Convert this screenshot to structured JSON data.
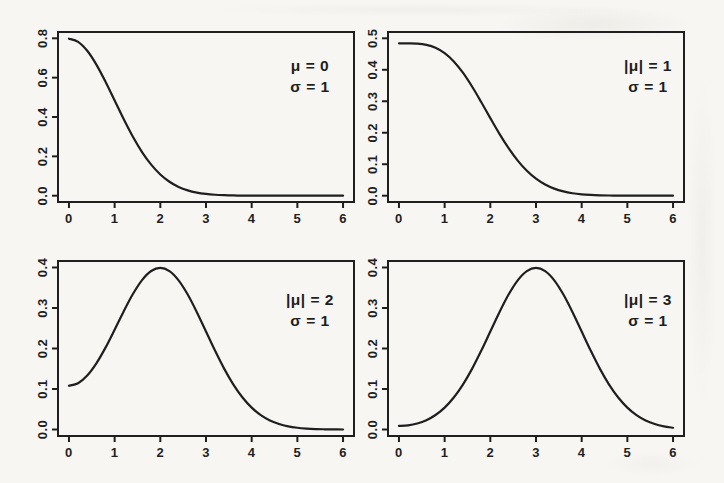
{
  "page": {
    "paper_color": "#f7f6f2",
    "line_color": "#1f1f1f"
  },
  "chart_data": [
    {
      "type": "line",
      "panel": "top-left",
      "title": "",
      "xlabel": "",
      "ylabel": "",
      "annotation": [
        "μ = 0",
        "σ = 1"
      ],
      "legend": null,
      "grid": false,
      "xlim": [
        0,
        6
      ],
      "ylim": [
        0,
        0.8
      ],
      "xticks": [
        0,
        1,
        2,
        3,
        4,
        5,
        6
      ],
      "xtick_labels": [
        "0",
        "1",
        "2",
        "3",
        "4",
        "5",
        "6"
      ],
      "yticks": [
        0,
        0.2,
        0.4,
        0.6,
        0.8
      ],
      "ytick_labels": [
        "0.0",
        "0.2",
        "0.4",
        "0.6",
        "0.8"
      ],
      "x": [
        0,
        0.2,
        0.4,
        0.6,
        0.8,
        1,
        1.2,
        1.4,
        1.6,
        1.8,
        2,
        2.2,
        2.4,
        2.6,
        2.8,
        3,
        3.2,
        3.4,
        3.6,
        3.8,
        4,
        4.2,
        4.4,
        4.6,
        4.8,
        5,
        5.2,
        5.4,
        5.6,
        5.8,
        6
      ],
      "y": [
        0.7979,
        0.7821,
        0.7365,
        0.6664,
        0.5794,
        0.4839,
        0.3884,
        0.2995,
        0.2218,
        0.1579,
        0.108,
        0.071,
        0.0448,
        0.0272,
        0.0158,
        0.0089,
        0.0048,
        0.0025,
        0.0012,
        0.0006,
        0.0003,
        0.0001,
        0.0001,
        0.0,
        0.0,
        0.0,
        0.0,
        0.0,
        0.0,
        0.0,
        0.0
      ]
    },
    {
      "type": "line",
      "panel": "top-right",
      "title": "",
      "xlabel": "",
      "ylabel": "",
      "annotation": [
        "|μ| = 1",
        "σ = 1"
      ],
      "legend": null,
      "grid": false,
      "xlim": [
        0,
        6
      ],
      "ylim": [
        0,
        0.5
      ],
      "xticks": [
        0,
        1,
        2,
        3,
        4,
        5,
        6
      ],
      "xtick_labels": [
        "0",
        "1",
        "2",
        "3",
        "4",
        "5",
        "6"
      ],
      "yticks": [
        0,
        0.1,
        0.2,
        0.3,
        0.4,
        0.5
      ],
      "ytick_labels": [
        "0.0",
        "0.1",
        "0.2",
        "0.3",
        "0.4",
        "0.5"
      ],
      "x": [
        0,
        0.2,
        0.4,
        0.6,
        0.8,
        1,
        1.2,
        1.4,
        1.6,
        1.8,
        2,
        2.2,
        2.4,
        2.6,
        2.8,
        3,
        3.2,
        3.4,
        3.6,
        3.8,
        4,
        4.2,
        4.4,
        4.6,
        4.8,
        5,
        5.2,
        5.4,
        5.6,
        5.8,
        6
      ],
      "y": [
        0.4839,
        0.4839,
        0.483,
        0.4792,
        0.47,
        0.4529,
        0.4265,
        0.3907,
        0.3468,
        0.2976,
        0.2464,
        0.1966,
        0.151,
        0.1115,
        0.0792,
        0.0541,
        0.0355,
        0.0224,
        0.0136,
        0.0079,
        0.0044,
        0.0024,
        0.0012,
        0.0006,
        0.0003,
        0.0001,
        0.0001,
        0.0,
        0.0,
        0.0,
        0.0
      ]
    },
    {
      "type": "line",
      "panel": "bottom-left",
      "title": "",
      "xlabel": "",
      "ylabel": "",
      "annotation": [
        "|μ| = 2",
        "σ = 1"
      ],
      "legend": null,
      "grid": false,
      "xlim": [
        0,
        6
      ],
      "ylim": [
        0,
        0.4
      ],
      "xticks": [
        0,
        1,
        2,
        3,
        4,
        5,
        6
      ],
      "xtick_labels": [
        "0",
        "1",
        "2",
        "3",
        "4",
        "5",
        "6"
      ],
      "yticks": [
        0,
        0.1,
        0.2,
        0.3,
        0.4
      ],
      "ytick_labels": [
        "0.0",
        "0.1",
        "0.2",
        "0.3",
        "0.4"
      ],
      "x": [
        0,
        0.2,
        0.4,
        0.6,
        0.8,
        1,
        1.2,
        1.4,
        1.6,
        1.8,
        2,
        2.2,
        2.4,
        2.6,
        2.8,
        3,
        3.2,
        3.4,
        3.6,
        3.8,
        4,
        4.2,
        4.4,
        4.6,
        4.8,
        5,
        5.2,
        5.4,
        5.6,
        5.8,
        6
      ],
      "y": [
        0.108,
        0.1144,
        0.1333,
        0.1633,
        0.2021,
        0.2464,
        0.2921,
        0.3345,
        0.3689,
        0.3913,
        0.3991,
        0.3911,
        0.3683,
        0.3332,
        0.2897,
        0.242,
        0.1942,
        0.1497,
        0.1109,
        0.079,
        0.054,
        0.0355,
        0.0224,
        0.0136,
        0.0079,
        0.0044,
        0.0024,
        0.0012,
        0.0006,
        0.0003,
        0.0001
      ]
    },
    {
      "type": "line",
      "panel": "bottom-right",
      "title": "",
      "xlabel": "",
      "ylabel": "",
      "annotation": [
        "|μ| = 3",
        "σ = 1"
      ],
      "legend": null,
      "grid": false,
      "xlim": [
        0,
        6
      ],
      "ylim": [
        0,
        0.4
      ],
      "xticks": [
        0,
        1,
        2,
        3,
        4,
        5,
        6
      ],
      "xtick_labels": [
        "0",
        "1",
        "2",
        "3",
        "4",
        "5",
        "6"
      ],
      "yticks": [
        0,
        0.1,
        0.2,
        0.3,
        0.4
      ],
      "ytick_labels": [
        "0.0",
        "0.1",
        "0.2",
        "0.3",
        "0.4"
      ],
      "x": [
        0,
        0.2,
        0.4,
        0.6,
        0.8,
        1,
        1.2,
        1.4,
        1.6,
        1.8,
        2,
        2.2,
        2.4,
        2.6,
        2.8,
        3,
        3.2,
        3.4,
        3.6,
        3.8,
        4,
        4.2,
        4.4,
        4.6,
        4.8,
        5,
        5.2,
        5.4,
        5.6,
        5.8,
        6
      ],
      "y": [
        0.0089,
        0.0103,
        0.0148,
        0.023,
        0.0358,
        0.0541,
        0.079,
        0.1109,
        0.1497,
        0.1942,
        0.242,
        0.2897,
        0.3332,
        0.3683,
        0.391,
        0.3989,
        0.391,
        0.3683,
        0.3332,
        0.2897,
        0.242,
        0.1942,
        0.1497,
        0.1109,
        0.079,
        0.0541,
        0.0355,
        0.0224,
        0.0136,
        0.0079,
        0.0044
      ]
    }
  ]
}
